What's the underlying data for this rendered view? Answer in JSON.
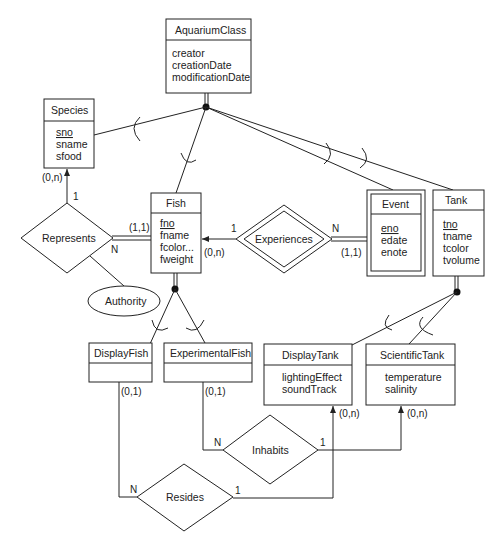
{
  "entities": {
    "aquarium_class": {
      "name": "AquariumClass",
      "attributes": [
        "creator",
        "creationDate",
        "modificationDate"
      ]
    },
    "species": {
      "name": "Species",
      "attributes": [
        "sno",
        "sname",
        "sfood"
      ],
      "key": "sno"
    },
    "fish": {
      "name": "Fish",
      "attributes": [
        "fno",
        "fname",
        "fcolor...",
        "fweight"
      ],
      "key": "fno"
    },
    "event": {
      "name": "Event",
      "attributes": [
        "eno",
        "edate",
        "enote"
      ],
      "key": "eno",
      "weak": true
    },
    "tank": {
      "name": "Tank",
      "attributes": [
        "tno",
        "tname",
        "tcolor",
        "tvolume"
      ],
      "key": "tno"
    },
    "display_fish": {
      "name": "DisplayFish",
      "attributes": []
    },
    "experimental_fish": {
      "name": "ExperimentalFish",
      "attributes": []
    },
    "display_tank": {
      "name": "DisplayTank",
      "attributes": [
        "lightingEffect",
        "soundTrack"
      ]
    },
    "scientific_tank": {
      "name": "ScientificTank",
      "attributes": [
        "temperature",
        "salinity"
      ]
    }
  },
  "relationships": {
    "represents": {
      "name": "Represents",
      "card_species": "1",
      "card_fish": "N",
      "part_species": "(0,n)",
      "part_fish": "(1,1)",
      "attribute": "Authority"
    },
    "experiences": {
      "name": "Experiences",
      "card_fish": "1",
      "card_event": "N",
      "part_fish": "(0,n)",
      "part_event": "(1,1)"
    },
    "inhabits": {
      "name": "Inhabits",
      "card_fish": "N",
      "card_tank": "1",
      "part_fish": "(0,1)",
      "part_tank": "(0,n)"
    },
    "resides": {
      "name": "Resides",
      "card_fish": "N",
      "card_tank": "1",
      "part_fish": "(0,1)",
      "part_tank": "(0,n)"
    }
  }
}
